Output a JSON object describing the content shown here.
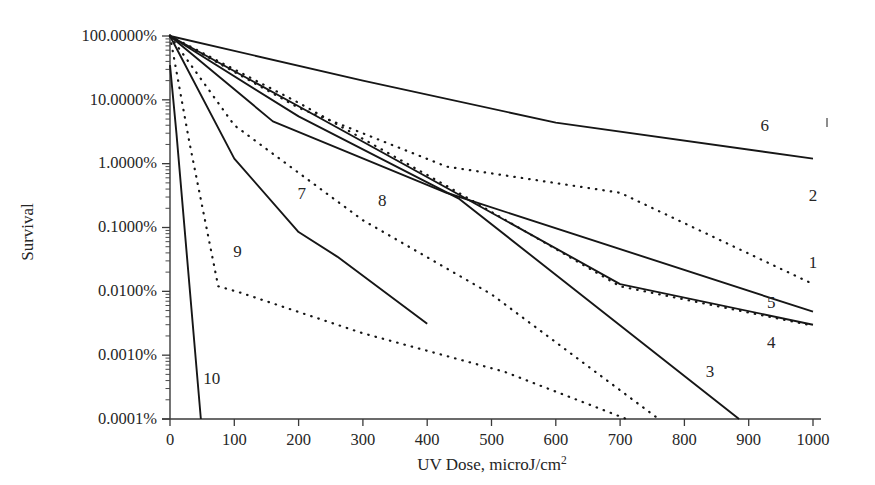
{
  "chart_data": {
    "type": "line",
    "title": "",
    "xlabel": "UV Dose, microJ/cm2",
    "xlabel_base": "UV Dose, microJ/cm",
    "xlabel_sup": "2",
    "ylabel": "Survival",
    "xlim": [
      0,
      1000
    ],
    "ylim": [
      0.0001,
      100
    ],
    "yscale": "log10-percent",
    "grid": false,
    "legend": "inline-end-labels",
    "xticks": [
      0,
      100,
      200,
      300,
      400,
      500,
      600,
      700,
      800,
      900,
      1000
    ],
    "xtick_labels": [
      "0",
      "100",
      "200",
      "300",
      "400",
      "500",
      "600",
      "700",
      "800",
      "900",
      "1000"
    ],
    "yticks": [
      100,
      10,
      1,
      0.1,
      0.01,
      0.001,
      0.0001
    ],
    "ytick_labels": [
      "100.0000%",
      "10.0000%",
      "1.0000%",
      "0.1000%",
      "0.0100%",
      "0.0010%",
      "0.0001%"
    ],
    "series": [
      {
        "name": "1",
        "label": "1",
        "style": "solid",
        "label_x": 1000,
        "label_y": 0.023,
        "points": [
          [
            0,
            100
          ],
          [
            160,
            4.6
          ],
          [
            430,
            0.35
          ],
          [
            1000,
            0.0048
          ]
        ]
      },
      {
        "name": "2",
        "label": "2",
        "style": "dotted",
        "label_x": 1000,
        "label_y": 0.26,
        "points": [
          [
            0,
            100
          ],
          [
            200,
            7.5
          ],
          [
            430,
            0.9
          ],
          [
            700,
            0.35
          ],
          [
            1000,
            0.013
          ]
        ]
      },
      {
        "name": "3",
        "label": "3",
        "style": "solid",
        "label_x": 840,
        "label_y": 0.00045,
        "points": [
          [
            0,
            100
          ],
          [
            200,
            5.5
          ],
          [
            450,
            0.28
          ],
          [
            885,
            0.0001
          ]
        ]
      },
      {
        "name": "4",
        "label": "4",
        "style": "dotted",
        "label_x": 935,
        "label_y": 0.0013,
        "points": [
          [
            0,
            100
          ],
          [
            200,
            9.0
          ],
          [
            430,
            0.45
          ],
          [
            700,
            0.012
          ],
          [
            1000,
            0.0029
          ]
        ]
      },
      {
        "name": "5",
        "label": "5",
        "style": "solid",
        "label_x": 935,
        "label_y": 0.0055,
        "points": [
          [
            0,
            100
          ],
          [
            190,
            9.0
          ],
          [
            430,
            0.42
          ],
          [
            700,
            0.013
          ],
          [
            1000,
            0.003
          ]
        ]
      },
      {
        "name": "6",
        "label": "6",
        "style": "solid",
        "label_x": 925,
        "label_y": 3.2,
        "points": [
          [
            0,
            100
          ],
          [
            300,
            20
          ],
          [
            600,
            4.4
          ],
          [
            1000,
            1.2
          ]
        ]
      },
      {
        "name": "7",
        "label": "7",
        "style": "solid",
        "label_x": 205,
        "label_y": 0.28,
        "points": [
          [
            0,
            100
          ],
          [
            100,
            1.2
          ],
          [
            200,
            0.085
          ],
          [
            260,
            0.035
          ],
          [
            400,
            0.0031
          ]
        ]
      },
      {
        "name": "8",
        "label": "8",
        "style": "dotted",
        "label_x": 330,
        "label_y": 0.22,
        "points": [
          [
            0,
            100
          ],
          [
            100,
            4.0
          ],
          [
            300,
            0.13
          ],
          [
            500,
            0.009
          ],
          [
            760,
            0.0001
          ]
        ]
      },
      {
        "name": "9",
        "label": "9",
        "style": "dotted",
        "label_x": 105,
        "label_y": 0.035,
        "points": [
          [
            0,
            100
          ],
          [
            30,
            2.2
          ],
          [
            75,
            0.012
          ],
          [
            110,
            0.0095
          ],
          [
            300,
            0.0022
          ],
          [
            520,
            0.00055
          ],
          [
            710,
            0.0001
          ]
        ]
      },
      {
        "name": "10",
        "label": "10",
        "style": "solid",
        "label_x": 65,
        "label_y": 0.00035,
        "points": [
          [
            0,
            35
          ],
          [
            10,
            3.0
          ],
          [
            48,
            0.0001
          ]
        ]
      }
    ]
  }
}
